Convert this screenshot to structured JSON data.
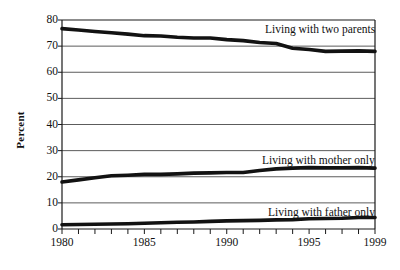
{
  "chart_data": {
    "type": "line",
    "title": "",
    "xlabel": "",
    "ylabel": "Percent",
    "xlim": [
      1980,
      1999
    ],
    "ylim": [
      0,
      80
    ],
    "yticks": [
      0,
      10,
      20,
      30,
      40,
      50,
      60,
      70,
      80
    ],
    "xticks": [
      1980,
      1981,
      1982,
      1983,
      1984,
      1985,
      1986,
      1987,
      1988,
      1989,
      1990,
      1991,
      1992,
      1993,
      1994,
      1995,
      1996,
      1997,
      1998,
      1999
    ],
    "xtick_labels": [
      "1980",
      "1985",
      "1990",
      "1995",
      "1999"
    ],
    "xtick_label_values": [
      1980,
      1985,
      1990,
      1995,
      1999
    ],
    "grid": "horizontal",
    "legend_position": "inline-right",
    "line_color": "#121212",
    "grid_color": "#4a4a4a",
    "axis_color": "#1a1a1a",
    "x": [
      1980,
      1981,
      1982,
      1983,
      1984,
      1985,
      1986,
      1987,
      1988,
      1989,
      1990,
      1991,
      1992,
      1993,
      1994,
      1995,
      1996,
      1997,
      1998,
      1999
    ],
    "series": [
      {
        "name": "Living with two parents",
        "label": "Living with two parents",
        "label_x": 1993.0,
        "label_y": 76.5,
        "values": [
          76.7,
          76.2,
          75.6,
          75.1,
          74.6,
          74.0,
          73.9,
          73.4,
          73.1,
          73.1,
          72.5,
          72.1,
          71.4,
          71.0,
          69.2,
          68.7,
          68.0,
          68.1,
          68.2,
          68.0
        ]
      },
      {
        "name": "Living with mother only",
        "label": "Living with mother only",
        "label_x": 1993.0,
        "label_y": 26.5,
        "values": [
          18.0,
          18.8,
          19.6,
          20.4,
          20.6,
          20.9,
          20.9,
          21.1,
          21.4,
          21.5,
          21.6,
          21.6,
          22.4,
          23.0,
          23.3,
          23.5,
          23.4,
          23.4,
          23.5,
          23.3
        ]
      },
      {
        "name": "Living with father only",
        "label": "Living with father only",
        "label_x": 1993.2,
        "label_y": 6.4,
        "values": [
          1.6,
          1.7,
          1.8,
          1.9,
          2.0,
          2.2,
          2.4,
          2.6,
          2.7,
          2.9,
          3.1,
          3.2,
          3.3,
          3.5,
          3.6,
          3.9,
          4.0,
          4.1,
          4.4,
          4.4
        ]
      }
    ]
  }
}
